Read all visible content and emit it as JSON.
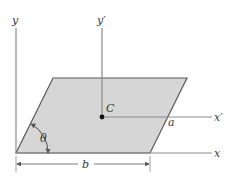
{
  "diagram": {
    "type": "parallelogram-centroid-axes",
    "colors": {
      "fill": "#d6d6d6",
      "stroke": "#5a5a5a",
      "axis": "#8a8a8a",
      "text": "#3a3a3a",
      "centroid": "#111111"
    },
    "labels": {
      "y_axis": "y",
      "y_prime_axis": "y′",
      "x_axis": "x",
      "x_prime_axis": "x′",
      "centroid": "C",
      "side_a": "a",
      "angle": "θ",
      "base_b": "b"
    }
  }
}
